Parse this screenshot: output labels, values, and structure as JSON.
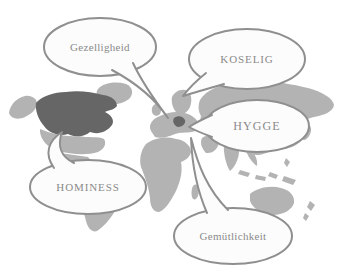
{
  "figure": {
    "kind": "world-map-speech-bubble-diagram"
  },
  "bubbles": [
    {
      "label": "Gezelligheid"
    },
    {
      "label": "KOSELIG"
    },
    {
      "label": "HYGGE"
    },
    {
      "label": "HOMINESS"
    },
    {
      "label": "Gemütlichkeit"
    }
  ],
  "colors": {
    "background": "#ffffff",
    "map_base": "#b3b3b3",
    "map_highlight": "#666666",
    "bubble_fill": "#fcfcfc",
    "bubble_stroke": "#8f8f8f",
    "label_text": "#8a8a8a"
  }
}
